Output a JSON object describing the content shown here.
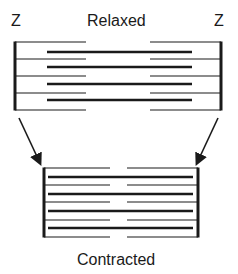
{
  "labels": {
    "z_left": "Z",
    "title_relaxed": "Relaxed",
    "z_right": "Z",
    "title_contracted": "Contracted"
  },
  "colors": {
    "ink": "#1a1a1a",
    "background": "#ffffff"
  },
  "relaxed": {
    "z_left_x": 15,
    "z_right_x": 221,
    "top_y": 42,
    "bottom_y": 110,
    "thin_lines_y": [
      42,
      59,
      76,
      93,
      110
    ],
    "thin_left_end_x": 86,
    "thin_right_start_x": 150,
    "thick_lines_y": [
      52,
      67,
      84,
      100
    ],
    "thick_start_x": 47,
    "thick_end_x": 192
  },
  "contracted": {
    "z_left_x": 44,
    "z_right_x": 198,
    "top_y": 168,
    "bottom_y": 237,
    "thin_lines_y": [
      168,
      185,
      202,
      220,
      237
    ],
    "thin_left_end_x": 110,
    "thin_right_start_x": 127,
    "thick_lines_y": [
      177,
      194,
      211,
      228
    ],
    "thick_start_x": 48,
    "thick_end_x": 193
  },
  "arrows": [
    {
      "from": [
        19,
        118
      ],
      "to": [
        40,
        163
      ]
    },
    {
      "from": [
        218,
        118
      ],
      "to": [
        197,
        163
      ]
    }
  ]
}
